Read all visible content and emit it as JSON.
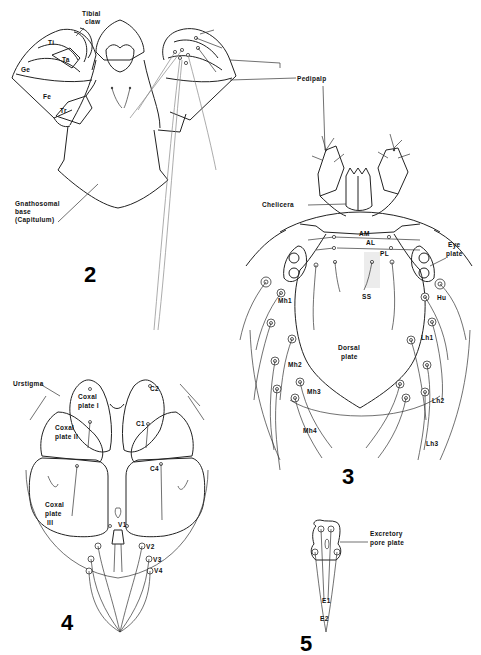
{
  "figure": {
    "panels": [
      {
        "number": "2",
        "subject": "gnathosoma"
      },
      {
        "number": "3",
        "subject": "dorsal view"
      },
      {
        "number": "4",
        "subject": "ventral view"
      },
      {
        "number": "5",
        "subject": "excretory pore plate"
      }
    ]
  },
  "fig2": {
    "number": "2",
    "labels": {
      "tibial_claw_1": "Tibial",
      "tibial_claw_2": "claw",
      "ti": "Ti",
      "ta": "Ta",
      "ge": "Ge",
      "fe": "Fe",
      "tr": "Tr",
      "pedipalp": "Pedipalp",
      "gnatho_1": "Gnathosomal",
      "gnatho_2": "base",
      "gnatho_3": "(Capitulum)"
    }
  },
  "fig3": {
    "number": "3",
    "labels": {
      "chelicera": "Chelicera",
      "am": "AM",
      "al": "AL",
      "pl": "PL",
      "eye_1": "Eye",
      "eye_2": "plate",
      "ss": "SS",
      "mh1": "Mh1",
      "hu": "Hu",
      "lh1": "Lh1",
      "dorsal_1": "Dorsal",
      "dorsal_2": "plate",
      "mh2": "Mh2",
      "mh3": "Mh3",
      "mh4": "Mh4",
      "lh2": "Lh2",
      "lh3": "Lh3"
    }
  },
  "fig4": {
    "number": "4",
    "labels": {
      "urstigma": "Urstigma",
      "coxal1_1": "Coxal",
      "coxal1_2": "plate I",
      "coxal2_1": "Coxal",
      "coxal2_2": "plate II",
      "coxal3_1": "Coxal",
      "coxal3_2": "plate",
      "coxal3_3": "III",
      "c2": "C2",
      "c1": "C1",
      "c4": "C4",
      "v1": "V1",
      "v2": "V2",
      "v3": "V3",
      "v4": "V4"
    }
  },
  "fig5": {
    "number": "5",
    "labels": {
      "excretory_1": "Excretory",
      "excretory_2": "pore plate",
      "e1": "E1",
      "e2": "E2"
    }
  },
  "colors": {
    "background": "#ffffff",
    "line": "#222222"
  }
}
